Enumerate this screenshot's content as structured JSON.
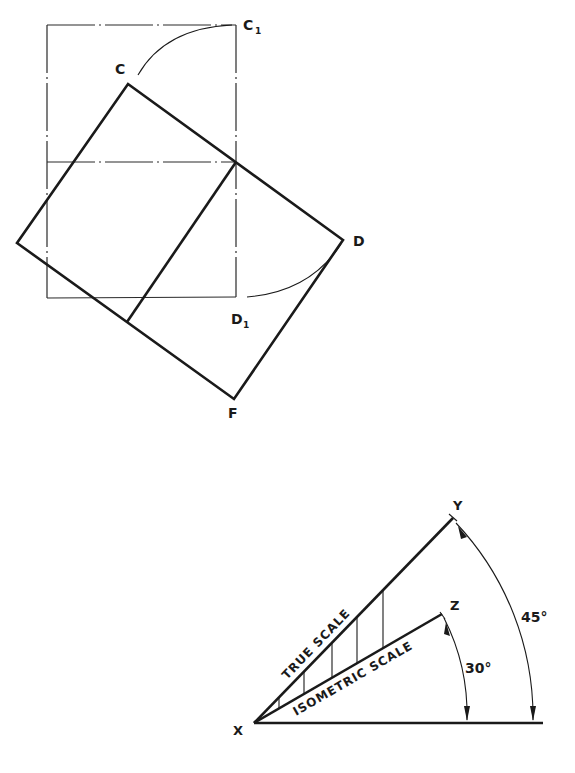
{
  "figure_top": {
    "labels": {
      "C": "C",
      "C1": "C",
      "C1_sub": "1",
      "D": "D",
      "D1": "D",
      "D1_sub": "1",
      "F": "F"
    }
  },
  "figure_bottom": {
    "labels": {
      "X": "X",
      "Y": "Y",
      "Z": "Z",
      "true_scale": "TRUE SCALE",
      "isometric_scale": "ISOMETRIC SCALE",
      "angle_30": "30°",
      "angle_45": "45°"
    },
    "angles_deg": {
      "isometric": 30,
      "true": 45
    }
  }
}
